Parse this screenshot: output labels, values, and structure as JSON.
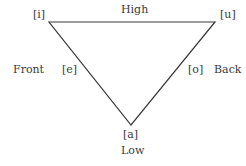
{
  "diagram": {
    "labels": {
      "high": "High",
      "low": "Low",
      "front": "Front",
      "back": "Back"
    },
    "vowels": {
      "i": "[i]",
      "u": "[u]",
      "e": "[e]",
      "o": "[o]",
      "a": "[a]"
    },
    "line_color": "#3a3a3a"
  }
}
